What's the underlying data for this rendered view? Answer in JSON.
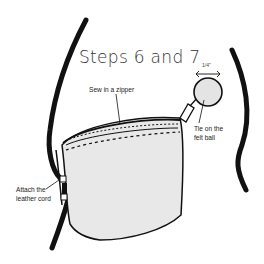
{
  "title": "Steps 6 and 7",
  "labels": {
    "sew_zipper": "Sew in a zipper",
    "tie_felt_ball_line1": "Tie on the",
    "tie_felt_ball_line2": "felt ball",
    "attach_cord_line1": "Attach the",
    "attach_cord_line2": "leather cord",
    "ball_size": "1/4\""
  },
  "colors": {
    "ink": "#111111",
    "bag_fill": "#e8e8e8",
    "ball_fill": "#e4e4e4",
    "background": "#ffffff"
  },
  "parts": [
    "leather-cord",
    "zipper",
    "zipper-pull",
    "felt-ball",
    "bag-body",
    "stitch-line"
  ]
}
